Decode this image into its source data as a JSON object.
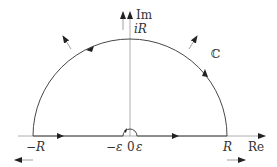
{
  "diagram": {
    "type": "contour-integral",
    "labels": {
      "im_axis": "Im",
      "re_axis": "Re",
      "top": "iR",
      "plane": "ℂ",
      "neg_r": "−R",
      "pos_r": "R",
      "neg_eps": "−ε",
      "origin": "0",
      "pos_eps": "ε"
    },
    "colors": {
      "line": "#333333",
      "axis": "#888888",
      "arrow": "#222222"
    }
  }
}
